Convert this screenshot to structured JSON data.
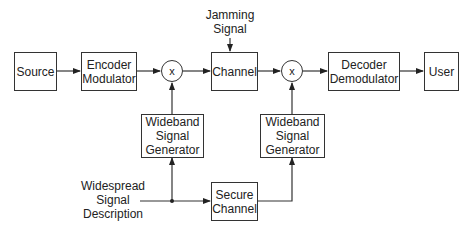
{
  "blocks": {
    "source": "Source",
    "encoder": "Encoder\nModulator",
    "mixer1": "x",
    "channel": "Channel",
    "mixer2": "x",
    "decoder": "Decoder\nDemodulator",
    "user": "User",
    "wideband1": "Wideband\nSignal\nGenerator",
    "wideband2": "Wideband\nSignal\nGenerator",
    "secure": "Secure\nChannel"
  },
  "labels": {
    "jamming": "Jamming\nSignal",
    "widespread": "Widespread\nSignal\nDescription"
  }
}
